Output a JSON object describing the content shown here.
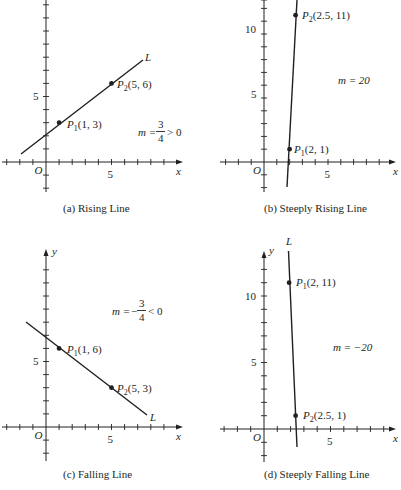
{
  "panels": [
    {
      "id": "a",
      "caption": "(a) Rising Line",
      "origin_px": [
        46,
        162
      ],
      "unit_px": 13.1,
      "y_arrow_top": 0,
      "x_arrow_right": 183,
      "x_ticks": [
        -3,
        -2,
        -1,
        1,
        2,
        3,
        4,
        5,
        6,
        7,
        8,
        9
      ],
      "y_ticks": [
        -2,
        -1,
        1,
        2,
        3,
        4,
        5,
        6,
        7,
        8,
        9,
        10,
        11,
        12
      ],
      "x_tick_label": "5",
      "y_tick_label": "5",
      "origin_label": "O",
      "x_label": "x",
      "y_label": "",
      "line_label": "L",
      "line": {
        "from": [
          -1.9,
          0.6
        ],
        "to": [
          7.5,
          7.7
        ]
      },
      "points": [
        {
          "name": "P",
          "sub": "1",
          "coords": "(1, 3)",
          "x": 1,
          "y": 3
        },
        {
          "name": "P",
          "sub": "2",
          "coords": "(5, 6)",
          "x": 5,
          "y": 6
        }
      ],
      "slope_text": "m = 3/4 > 0",
      "slope": {
        "lhs": "m =",
        "num": "3",
        "den": "4",
        "rhs": "> 0",
        "sign": ""
      }
    },
    {
      "id": "b",
      "caption": "(b) Steeply Rising Line",
      "origin_px": [
        264,
        162
      ],
      "unit_px": 12.8,
      "y_arrow_top": 0,
      "x_arrow_right": 396,
      "x_ticks": [
        -3,
        -2,
        -1,
        1,
        2,
        3,
        4,
        5,
        6,
        7,
        8,
        9
      ],
      "y_ticks": [
        -2,
        -1,
        1,
        2,
        3,
        4,
        5,
        6,
        7,
        8,
        9,
        10,
        11,
        12
      ],
      "x_tick_label": "5",
      "y_tick_label_5": "5",
      "y_tick_label_10": "10",
      "origin_label": "O",
      "x_label": "x",
      "line": {
        "from": [
          1.9,
          -1.9
        ],
        "to": [
          2.6,
          12.7
        ]
      },
      "points": [
        {
          "name": "P",
          "sub": "1",
          "coords": "(2, 1)",
          "x": 2,
          "y": 1
        },
        {
          "name": "P",
          "sub": "2",
          "coords": "(2.5, 11)",
          "x": 2.5,
          "y": 11
        }
      ],
      "slope_text": "m = 20"
    },
    {
      "id": "c",
      "caption": "(c) Falling Line",
      "origin_px": [
        46,
        427
      ],
      "unit_px": 13.1,
      "x_arrow_right": 183,
      "x_ticks": [
        -3,
        -2,
        -1,
        1,
        2,
        3,
        4,
        5,
        6,
        7,
        8,
        9
      ],
      "y_ticks": [
        -2,
        -1,
        1,
        2,
        3,
        4,
        5,
        6,
        7,
        8,
        9,
        10,
        11,
        12
      ],
      "x_tick_label": "5",
      "y_tick_label": "5",
      "origin_label": "O",
      "x_label": "x",
      "y_label": "y",
      "line_label": "L",
      "line": {
        "from": [
          -1.6,
          7.9
        ],
        "to": [
          7.7,
          0.9
        ]
      },
      "points": [
        {
          "name": "P",
          "sub": "1",
          "coords": "(1, 6)",
          "x": 1,
          "y": 6
        },
        {
          "name": "P",
          "sub": "2",
          "coords": "(5, 3)",
          "x": 5,
          "y": 3
        }
      ],
      "slope_text": "m = −3/4 < 0",
      "slope": {
        "lhs": "m =",
        "num": "3",
        "den": "4",
        "rhs": "< 0",
        "sign": "−"
      }
    },
    {
      "id": "d",
      "caption": "(d) Steeply Falling Line",
      "origin_px": [
        264,
        429
      ],
      "unit_px": 13.3,
      "x_arrow_right": 396,
      "x_ticks": [
        -3,
        -2,
        -1,
        1,
        2,
        3,
        4,
        5,
        6,
        7,
        8,
        9
      ],
      "y_ticks": [
        -2,
        -1,
        1,
        2,
        3,
        4,
        5,
        6,
        7,
        8,
        9,
        10,
        11,
        12
      ],
      "x_tick_label": "5",
      "y_tick_label_5": "5",
      "y_tick_label_10": "10",
      "origin_label": "O",
      "x_label": "x",
      "y_label": "y",
      "line_label": "L",
      "line": {
        "from": [
          1.85,
          13.5
        ],
        "to": [
          2.6,
          -1.3
        ]
      },
      "points": [
        {
          "name": "P",
          "sub": "1",
          "coords": "(2, 11)",
          "x": 2,
          "y": 11
        },
        {
          "name": "P",
          "sub": "2",
          "coords": "(2.5, 1)",
          "x": 2.5,
          "y": 1
        }
      ],
      "slope_text": "m = −20"
    }
  ]
}
